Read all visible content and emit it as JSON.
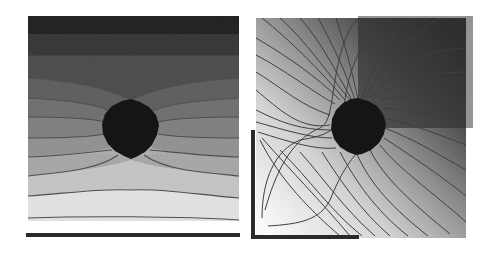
{
  "figure": {
    "description": "Two side-by-side grayscale contour plots of a potential/temperature field around a dark circular obstacle",
    "panels": [
      {
        "id": "left",
        "label": "Uniform field with circular inclusion",
        "field_bounds": {
          "x": 28,
          "y": 16,
          "w": 211,
          "h": 205
        },
        "top_boundary_color": "#1e1e1e",
        "gradient_top": "#3a3a3a",
        "gradient_bottom": "#f4f4f4",
        "bottom_bar": {
          "x": 26,
          "y": 233,
          "w": 214,
          "h": 4,
          "color": "#2a2a2a"
        },
        "obstacle": {
          "cx": 131,
          "cy": 128,
          "r": 27,
          "color": "#151515"
        },
        "contour_color": "#4a4a4a",
        "contour_count": 9
      },
      {
        "id": "right",
        "label": "Corner electrodes with circular inclusion",
        "field_bounds": {
          "x": 256,
          "y": 18,
          "w": 210,
          "h": 220
        },
        "top_right_electrode": {
          "x": 358,
          "y": 16,
          "w": 115,
          "h": 112,
          "color": "#3c3c3c"
        },
        "bottom_left_electrode": {
          "vx": 251,
          "vy": 130,
          "vh": 109,
          "hx": 251,
          "hy": 235,
          "hw": 108,
          "thickness": 4,
          "color": "#2a2a2a"
        },
        "gradient_dark": "#1f1f1f",
        "gradient_light": "#fafafa",
        "obstacle": {
          "cx": 358,
          "cy": 125,
          "r": 27,
          "color": "#151515"
        },
        "contour_color": "#3a3a3a",
        "contour_count": 22
      }
    ]
  }
}
